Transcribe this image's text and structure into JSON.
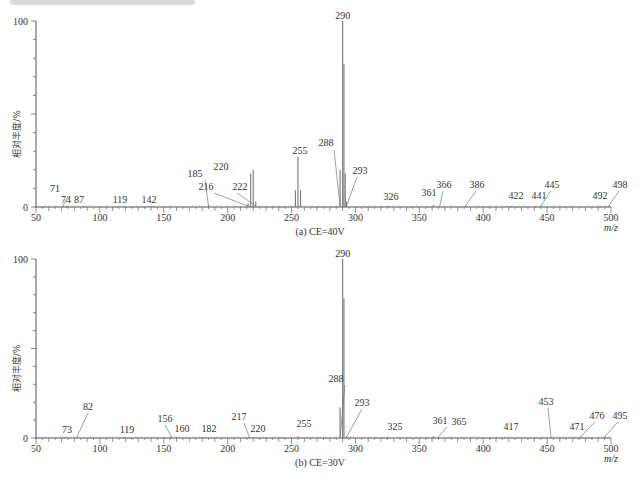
{
  "chart_data": [
    {
      "type": "bar",
      "title": "(a) CE=40V",
      "xlabel": "m/z",
      "ylabel": "相对丰度/%",
      "xlim": [
        50,
        500
      ],
      "ylim": [
        0,
        100
      ],
      "xticks": [
        50,
        100,
        150,
        200,
        250,
        300,
        350,
        400,
        450,
        500
      ],
      "yticks": [
        0,
        100
      ],
      "grid": false,
      "peaks": [
        {
          "mz": 71,
          "intensity": 0.5,
          "label": "71"
        },
        {
          "mz": 74,
          "intensity": 0.5,
          "label": "74"
        },
        {
          "mz": 87,
          "intensity": 0.5,
          "label": "87"
        },
        {
          "mz": 119,
          "intensity": 0.5,
          "label": "119"
        },
        {
          "mz": 142,
          "intensity": 0.5,
          "label": "142"
        },
        {
          "mz": 185,
          "intensity": 1,
          "label": "185"
        },
        {
          "mz": 216,
          "intensity": 2,
          "label": "216"
        },
        {
          "mz": 218,
          "intensity": 18,
          "label": ""
        },
        {
          "mz": 220,
          "intensity": 20,
          "label": "220"
        },
        {
          "mz": 222,
          "intensity": 3,
          "label": "222"
        },
        {
          "mz": 253,
          "intensity": 9,
          "label": ""
        },
        {
          "mz": 255,
          "intensity": 27,
          "label": "255"
        },
        {
          "mz": 257,
          "intensity": 9,
          "label": ""
        },
        {
          "mz": 288,
          "intensity": 20,
          "label": "288"
        },
        {
          "mz": 290,
          "intensity": 100,
          "label": "290"
        },
        {
          "mz": 291,
          "intensity": 77,
          "label": ""
        },
        {
          "mz": 292,
          "intensity": 18,
          "label": ""
        },
        {
          "mz": 293,
          "intensity": 3,
          "label": "293"
        },
        {
          "mz": 326,
          "intensity": 0.5,
          "label": "326"
        },
        {
          "mz": 361,
          "intensity": 1,
          "label": "361"
        },
        {
          "mz": 366,
          "intensity": 0.5,
          "label": "366"
        },
        {
          "mz": 386,
          "intensity": 0.5,
          "label": "386"
        },
        {
          "mz": 422,
          "intensity": 0.5,
          "label": "422"
        },
        {
          "mz": 441,
          "intensity": 0.5,
          "label": "441"
        },
        {
          "mz": 445,
          "intensity": 0.5,
          "label": "445"
        },
        {
          "mz": 492,
          "intensity": 0.5,
          "label": "492"
        },
        {
          "mz": 498,
          "intensity": 0.5,
          "label": "498"
        }
      ]
    },
    {
      "type": "bar",
      "title": "(b) CE=30V",
      "xlabel": "m/z",
      "ylabel": "相对丰度/%",
      "xlim": [
        50,
        500
      ],
      "ylim": [
        0,
        100
      ],
      "xticks": [
        50,
        100,
        150,
        200,
        250,
        300,
        350,
        400,
        450,
        500
      ],
      "yticks": [
        0,
        100
      ],
      "grid": false,
      "peaks": [
        {
          "mz": 73,
          "intensity": 0.5,
          "label": "73"
        },
        {
          "mz": 82,
          "intensity": 0.5,
          "label": "82"
        },
        {
          "mz": 119,
          "intensity": 0.5,
          "label": "119"
        },
        {
          "mz": 156,
          "intensity": 0.5,
          "label": "156"
        },
        {
          "mz": 160,
          "intensity": 0.5,
          "label": "160"
        },
        {
          "mz": 182,
          "intensity": 0.5,
          "label": "182"
        },
        {
          "mz": 217,
          "intensity": 0.5,
          "label": "217"
        },
        {
          "mz": 220,
          "intensity": 0.5,
          "label": "220"
        },
        {
          "mz": 255,
          "intensity": 1,
          "label": "255"
        },
        {
          "mz": 288,
          "intensity": 17,
          "label": "288"
        },
        {
          "mz": 290,
          "intensity": 100,
          "label": "290"
        },
        {
          "mz": 291,
          "intensity": 78,
          "label": ""
        },
        {
          "mz": 293,
          "intensity": 1,
          "label": "293"
        },
        {
          "mz": 325,
          "intensity": 0.5,
          "label": "325"
        },
        {
          "mz": 361,
          "intensity": 1,
          "label": "361"
        },
        {
          "mz": 365,
          "intensity": 0.5,
          "label": "365"
        },
        {
          "mz": 417,
          "intensity": 0.5,
          "label": "417"
        },
        {
          "mz": 453,
          "intensity": 0.5,
          "label": "453"
        },
        {
          "mz": 471,
          "intensity": 0.5,
          "label": "471"
        },
        {
          "mz": 476,
          "intensity": 0.5,
          "label": "476"
        },
        {
          "mz": 495,
          "intensity": 0.5,
          "label": "495"
        }
      ]
    }
  ],
  "labels": {
    "a": [
      {
        "t": "71",
        "x": 55,
        "y": 192,
        "lx": 68,
        "ly": 196,
        "px": 71
      },
      {
        "t": "74",
        "x": 66,
        "y": 203,
        "px": 74
      },
      {
        "t": "87",
        "x": 79,
        "y": 203,
        "px": 87
      },
      {
        "t": "119",
        "x": 120,
        "y": 203,
        "px": 119
      },
      {
        "t": "142",
        "x": 149,
        "y": 203,
        "px": 142
      },
      {
        "t": "185",
        "x": 195,
        "y": 177,
        "lx": 205,
        "ly": 180,
        "px": 185
      },
      {
        "t": "216",
        "x": 206,
        "y": 190,
        "lx": 214,
        "ly": 193,
        "px": 216
      },
      {
        "t": "220",
        "x": 221,
        "y": 170,
        "px": 220
      },
      {
        "t": "222",
        "x": 240,
        "y": 190,
        "lx": 237,
        "ly": 193,
        "px": 222
      },
      {
        "t": "255",
        "x": 300,
        "y": 154,
        "px": 255
      },
      {
        "t": "288",
        "x": 326,
        "y": 146,
        "lx": 334,
        "ly": 150,
        "px": 288
      },
      {
        "t": "293",
        "x": 360,
        "y": 174,
        "lx": 357,
        "ly": 177,
        "px": 293
      },
      {
        "t": "326",
        "x": 391,
        "y": 200,
        "px": 326
      },
      {
        "t": "361",
        "x": 429,
        "y": 196,
        "px": 361
      },
      {
        "t": "366",
        "x": 444,
        "y": 188,
        "lx": 443,
        "ly": 191,
        "px": 366
      },
      {
        "t": "386",
        "x": 477,
        "y": 188,
        "lx": 476,
        "ly": 191,
        "px": 386
      },
      {
        "t": "422",
        "x": 516,
        "y": 199,
        "px": 422
      },
      {
        "t": "441",
        "x": 539,
        "y": 199,
        "px": 441
      },
      {
        "t": "445",
        "x": 552,
        "y": 188,
        "lx": 551,
        "ly": 191,
        "px": 445
      },
      {
        "t": "492",
        "x": 600,
        "y": 199,
        "px": 492
      },
      {
        "t": "498",
        "x": 620,
        "y": 188,
        "lx": 619,
        "ly": 191,
        "px": 498
      }
    ],
    "b": [
      {
        "t": "73",
        "x": 67,
        "y": 433,
        "px": 73
      },
      {
        "t": "82",
        "x": 88,
        "y": 410,
        "lx": 88,
        "ly": 413,
        "px": 82
      },
      {
        "t": "119",
        "x": 127,
        "y": 433,
        "px": 119
      },
      {
        "t": "156",
        "x": 165,
        "y": 422,
        "lx": 165,
        "ly": 425,
        "px": 156
      },
      {
        "t": "160",
        "x": 182,
        "y": 432,
        "px": 160
      },
      {
        "t": "182",
        "x": 209,
        "y": 432,
        "px": 182
      },
      {
        "t": "217",
        "x": 239,
        "y": 420,
        "lx": 244,
        "ly": 423,
        "px": 217
      },
      {
        "t": "220",
        "x": 258,
        "y": 432,
        "px": 220
      },
      {
        "t": "255",
        "x": 304,
        "y": 427,
        "px": 255
      },
      {
        "t": "288",
        "x": 336,
        "y": 382,
        "lx": 345,
        "ly": 385,
        "px": 288
      },
      {
        "t": "293",
        "x": 362,
        "y": 406,
        "lx": 362,
        "ly": 409,
        "px": 293
      },
      {
        "t": "325",
        "x": 395,
        "y": 430,
        "px": 325
      },
      {
        "t": "361",
        "x": 440,
        "y": 424,
        "px": 361
      },
      {
        "t": "365",
        "x": 459,
        "y": 425,
        "lx": 447,
        "ly": 427,
        "px": 365
      },
      {
        "t": "417",
        "x": 511,
        "y": 430,
        "px": 417
      },
      {
        "t": "453",
        "x": 546,
        "y": 405,
        "lx": 548,
        "ly": 408,
        "px": 453
      },
      {
        "t": "471",
        "x": 577,
        "y": 430,
        "px": 471
      },
      {
        "t": "476",
        "x": 597,
        "y": 419,
        "lx": 595,
        "ly": 422,
        "px": 476
      },
      {
        "t": "495",
        "x": 620,
        "y": 419,
        "lx": 618,
        "ly": 422,
        "px": 495
      }
    ]
  },
  "axis": {
    "y100": "100",
    "y0": "0",
    "xunit": "m/z",
    "ylabel": "相对丰度/%",
    "caption_a": "(a) CE=40V",
    "caption_b": "(b) CE=30V"
  }
}
